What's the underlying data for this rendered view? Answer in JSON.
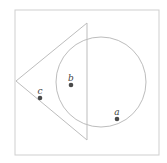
{
  "diagram": {
    "colors": {
      "frame": "#cfcfcf",
      "shape_stroke": "#bdbdbd",
      "point": "#4a4a4a",
      "label": "#444444"
    },
    "frame": {
      "x": 15,
      "y": 10,
      "width": 144,
      "height": 145
    },
    "triangle": {
      "points": [
        [
          87,
          23
        ],
        [
          16,
          81
        ],
        [
          87,
          140
        ]
      ]
    },
    "circle": {
      "cx": 101,
      "cy": 82,
      "r": 45
    },
    "points": [
      {
        "label": "a",
        "x": 117,
        "y": 119,
        "label_x": 117,
        "label_y": 112
      },
      {
        "label": "b",
        "x": 71,
        "y": 85,
        "label_x": 71,
        "label_y": 78
      },
      {
        "label": "c",
        "x": 40,
        "y": 98,
        "label_x": 40,
        "label_y": 91
      }
    ]
  }
}
